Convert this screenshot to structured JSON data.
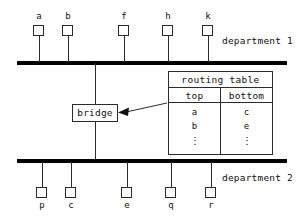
{
  "diagram": {
    "colors": {
      "bus": "#000000",
      "line": "#2b2b2b",
      "text": "#111111",
      "background": "#ffffff"
    }
  },
  "top_segment": {
    "label": "department 1",
    "stations": [
      {
        "name": "a",
        "x": 39
      },
      {
        "name": "b",
        "x": 68
      },
      {
        "name": "f",
        "x": 124
      },
      {
        "name": "h",
        "x": 168
      },
      {
        "name": "k",
        "x": 208
      }
    ]
  },
  "bottom_segment": {
    "label": "department 2",
    "stations": [
      {
        "name": "p",
        "x": 42
      },
      {
        "name": "c",
        "x": 71
      },
      {
        "name": "e",
        "x": 127
      },
      {
        "name": "q",
        "x": 171
      },
      {
        "name": "r",
        "x": 211
      }
    ]
  },
  "bridge": {
    "label": "bridge"
  },
  "routing_table": {
    "title": "routing table",
    "columns": [
      "top",
      "bottom"
    ],
    "rows": [
      [
        "a",
        "c"
      ],
      [
        "b",
        "e"
      ],
      [
        "⋮",
        "⋮"
      ]
    ]
  }
}
